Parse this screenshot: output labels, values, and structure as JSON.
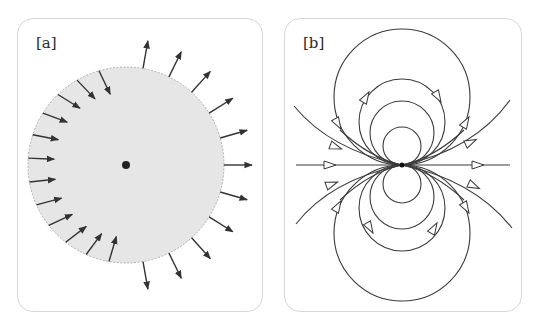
{
  "panels": [
    {
      "label": "[a]",
      "description": "Shaded disc with central point charge; arrows normal to boundary, pointing outward on right side and inward on left side",
      "disc": {
        "cx": 126,
        "cy": 165,
        "r": 98,
        "fill": "#e6e6e6",
        "edge": "#9a9a9a"
      },
      "center_dot": {
        "cx": 126,
        "cy": 165,
        "r": 4
      }
    },
    {
      "label": "[b]",
      "description": "Dipole field lines: circular loops tangent at the origin above and below, open curves to the sides, horizontal axis line, hollow triangular arrowheads",
      "center": {
        "cx": 402,
        "cy": 165
      }
    }
  ],
  "colors": {
    "line": "#3a3a3a",
    "panel_border": "#d6d6d6",
    "disc_fill": "#e6e6e6"
  }
}
